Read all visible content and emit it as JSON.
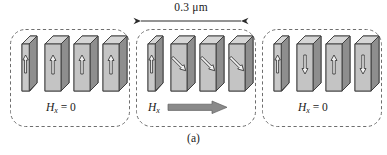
{
  "figure": {
    "caption": "(a)",
    "dimension": {
      "label": "0.3 μm",
      "arrow_name": "double-headed-dimension-arrow",
      "x_start": 140,
      "x_end": 242,
      "y": 21
    },
    "colors": {
      "front_face": "#b9b9b9",
      "front_face_light": "#c9c9c9",
      "side_face": "#8e8e8e",
      "top_face": "#d6d6d6",
      "outline": "#3a3a3a",
      "dashed_border": "#6e6e6e",
      "arrow_fill": "#f2f2f2",
      "arrow_outline": "#2b2b2b",
      "field_arrow": "#8a8a8a",
      "text": "#1a1a1a",
      "background": "#ffffff"
    },
    "panels": [
      {
        "id": "panel-left",
        "field_label_symbol": "H",
        "field_label_subscript": "x",
        "field_label_value": "= 0",
        "field_arrow": false,
        "x": 10,
        "y": 29,
        "width": 120,
        "height": 98,
        "elements": [
          {
            "name": "nanomagnet-bar-1",
            "thin": true,
            "arrow": "up"
          },
          {
            "name": "nanomagnet-bar-2",
            "thin": false,
            "arrow": "up"
          },
          {
            "name": "nanomagnet-bar-3",
            "thin": false,
            "arrow": "up"
          },
          {
            "name": "nanomagnet-bar-4",
            "thin": false,
            "arrow": "up"
          }
        ]
      },
      {
        "id": "panel-middle",
        "field_label_symbol": "H",
        "field_label_subscript": "x",
        "field_label_value": "",
        "field_arrow": true,
        "x": 136,
        "y": 29,
        "width": 120,
        "height": 98,
        "elements": [
          {
            "name": "nanomagnet-bar-1",
            "thin": true,
            "arrow": "up"
          },
          {
            "name": "nanomagnet-bar-2",
            "thin": false,
            "arrow": "tilt-down-right"
          },
          {
            "name": "nanomagnet-bar-3",
            "thin": false,
            "arrow": "tilt-down-right"
          },
          {
            "name": "nanomagnet-bar-4",
            "thin": false,
            "arrow": "tilt-down-right"
          }
        ]
      },
      {
        "id": "panel-right",
        "field_label_symbol": "H",
        "field_label_subscript": "x",
        "field_label_value": "= 0",
        "field_arrow": false,
        "x": 262,
        "y": 29,
        "width": 120,
        "height": 98,
        "elements": [
          {
            "name": "nanomagnet-bar-1",
            "thin": true,
            "arrow": "up"
          },
          {
            "name": "nanomagnet-bar-2",
            "thin": false,
            "arrow": "down"
          },
          {
            "name": "nanomagnet-bar-3",
            "thin": false,
            "arrow": "up"
          },
          {
            "name": "nanomagnet-bar-4",
            "thin": false,
            "arrow": "down"
          }
        ]
      }
    ]
  }
}
